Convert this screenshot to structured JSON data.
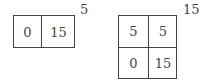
{
  "diagrams": [
    {
      "label": "5",
      "rows": 1,
      "cols": 2,
      "cells": [
        "0",
        "15"
      ]
    },
    {
      "label": "15",
      "rows": 2,
      "cols": 2,
      "cells": [
        "5",
        "5",
        "0",
        "15"
      ]
    }
  ]
}
